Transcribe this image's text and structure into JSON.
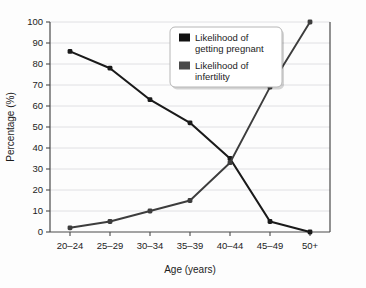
{
  "chart_data": {
    "type": "line",
    "title": "",
    "xlabel": "Age (years)",
    "ylabel": "Percentage (%)",
    "categories": [
      "20–24",
      "25–29",
      "30–34",
      "35–39",
      "40–44",
      "45–49",
      "50+"
    ],
    "ylim": [
      0,
      100
    ],
    "yticks": [
      0,
      10,
      20,
      30,
      40,
      50,
      60,
      70,
      80,
      90,
      100
    ],
    "grid": true,
    "legend_position": "top-center",
    "series": [
      {
        "name": "Likelihood of getting pregnant",
        "color": "#1a1a1a",
        "values": [
          86,
          78,
          63,
          52,
          35,
          5,
          0
        ]
      },
      {
        "name": "Likelihood of infertility",
        "color": "#3d3d3d",
        "values": [
          2,
          5,
          10,
          15,
          33,
          69,
          100
        ]
      }
    ]
  },
  "legend": {
    "entries": [
      {
        "label_line1": "Likelihood of",
        "label_line2": "getting pregnant",
        "swatch": "#111111"
      },
      {
        "label_line1": "Likelihood of",
        "label_line2": "infertility",
        "swatch": "#4a4a4a"
      }
    ]
  },
  "colors": {
    "background": "#fdfdfd",
    "axis": "#4a4a4a",
    "grid": "#d8d8dc",
    "text": "#1c1c1c",
    "legend_border": "#b6b6b6",
    "legend_fill": "#ffffff"
  }
}
